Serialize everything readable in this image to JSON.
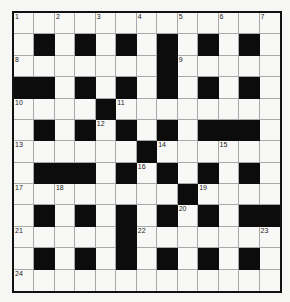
{
  "puzzle": {
    "rows": 13,
    "cols": 13,
    "grid": [
      ".............",
      ".#.#.#.#.#.#.",
      ".......#.....",
      "##.#.#.#.#.#.",
      "....#........",
      ".#.#.#.#.###.",
      "......#......",
      ".###.#.#.#.#.",
      "........#....",
      ".#.#.#.#.#.##",
      ".....#.......",
      ".#.#.#.#.#.#.",
      "............."
    ],
    "numbers": [
      {
        "r": 0,
        "c": 0,
        "n": "1"
      },
      {
        "r": 0,
        "c": 2,
        "n": "2"
      },
      {
        "r": 0,
        "c": 4,
        "n": "3"
      },
      {
        "r": 0,
        "c": 6,
        "n": "4"
      },
      {
        "r": 0,
        "c": 8,
        "n": "5"
      },
      {
        "r": 0,
        "c": 10,
        "n": "6"
      },
      {
        "r": 0,
        "c": 12,
        "n": "7"
      },
      {
        "r": 2,
        "c": 0,
        "n": "8"
      },
      {
        "r": 2,
        "c": 8,
        "n": "9"
      },
      {
        "r": 4,
        "c": 0,
        "n": "10"
      },
      {
        "r": 4,
        "c": 5,
        "n": "11"
      },
      {
        "r": 5,
        "c": 4,
        "n": "12"
      },
      {
        "r": 6,
        "c": 0,
        "n": "13"
      },
      {
        "r": 6,
        "c": 7,
        "n": "14"
      },
      {
        "r": 6,
        "c": 10,
        "n": "15"
      },
      {
        "r": 7,
        "c": 6,
        "n": "16"
      },
      {
        "r": 8,
        "c": 0,
        "n": "17"
      },
      {
        "r": 8,
        "c": 2,
        "n": "18"
      },
      {
        "r": 8,
        "c": 9,
        "n": "19"
      },
      {
        "r": 9,
        "c": 8,
        "n": "20"
      },
      {
        "r": 10,
        "c": 0,
        "n": "21"
      },
      {
        "r": 10,
        "c": 6,
        "n": "22"
      },
      {
        "r": 10,
        "c": 12,
        "n": "23"
      },
      {
        "r": 12,
        "c": 0,
        "n": "24"
      }
    ]
  }
}
